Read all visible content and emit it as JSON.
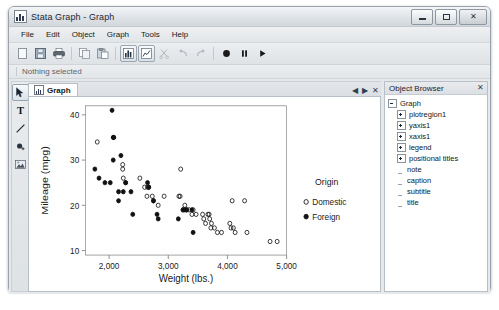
{
  "window": {
    "title": "Stata Graph - Graph",
    "icon": "stata-graph-icon",
    "buttons": {
      "minimize": "minimize-button",
      "maximize": "maximize-button",
      "close": "✕"
    }
  },
  "menu": {
    "items": [
      {
        "label": "File",
        "accel": "F"
      },
      {
        "label": "Edit",
        "accel": "E"
      },
      {
        "label": "Object",
        "accel": "O"
      },
      {
        "label": "Graph",
        "accel": "G"
      },
      {
        "label": "Tools",
        "accel": "T"
      },
      {
        "label": "Help",
        "accel": "H"
      }
    ]
  },
  "toolbar": {
    "buttons": [
      {
        "name": "new-icon",
        "active": false
      },
      {
        "name": "save-icon",
        "active": false
      },
      {
        "name": "print-icon",
        "active": false
      },
      {
        "name": "copy-icon",
        "active": false
      },
      {
        "name": "paste-icon",
        "active": false
      },
      {
        "name": "graph-editor-icon",
        "active": true
      },
      {
        "name": "grid-edit-icon",
        "active": true
      },
      {
        "name": "cut-scissors-icon",
        "active": false
      },
      {
        "name": "undo-icon",
        "active": false
      },
      {
        "name": "redo-icon",
        "active": false
      },
      {
        "name": "record-icon",
        "active": false
      },
      {
        "name": "pause-icon",
        "active": false
      },
      {
        "name": "play-icon",
        "active": false
      }
    ]
  },
  "status_strip": {
    "text": "Nothing selected"
  },
  "tool_palette": {
    "tools": [
      {
        "name": "pointer-tool-icon",
        "active": true
      },
      {
        "name": "text-tool-icon",
        "active": false
      },
      {
        "name": "line-tool-icon",
        "active": false
      },
      {
        "name": "marker-tool-icon",
        "active": false
      },
      {
        "name": "image-tool-icon",
        "active": false
      }
    ]
  },
  "document_tabs": {
    "tabs": [
      {
        "label": "Graph",
        "icon": "graph-tab-icon",
        "active": true
      }
    ],
    "nav": {
      "prev": "◀",
      "next": "▶",
      "close": "✕"
    }
  },
  "object_browser": {
    "title": "Object Browser",
    "close": "✕",
    "tree": [
      {
        "label": "Graph",
        "level": 1,
        "expander": "minus"
      },
      {
        "label": "plotregion1",
        "level": 2,
        "expander": "plus"
      },
      {
        "label": "yaxis1",
        "level": 2,
        "expander": "plus"
      },
      {
        "label": "xaxis1",
        "level": 2,
        "expander": "plus"
      },
      {
        "label": "legend",
        "level": 2,
        "expander": "plus"
      },
      {
        "label": "positional titles",
        "level": 2,
        "expander": "plus"
      },
      {
        "label": "note",
        "level": 2,
        "expander": "leaf"
      },
      {
        "label": "caption",
        "level": 2,
        "expander": "leaf"
      },
      {
        "label": "subtitle",
        "level": 2,
        "expander": "leaf"
      },
      {
        "label": "title",
        "level": 2,
        "expander": "leaf"
      }
    ]
  },
  "chart_data": {
    "type": "scatter",
    "title": "",
    "xlabel": "Weight (lbs.)",
    "ylabel": "Mileage (mpg)",
    "xlim": [
      1600,
      5000
    ],
    "ylim": [
      9,
      42
    ],
    "xticks": [
      2000,
      3000,
      4000,
      5000
    ],
    "xtick_labels": [
      "2,000",
      "3,000",
      "4,000",
      "5,000"
    ],
    "yticks": [
      10,
      20,
      30,
      40
    ],
    "ytick_labels": [
      "10",
      "20",
      "30",
      "40"
    ],
    "grid": false,
    "legend": {
      "title": "Origin",
      "position": "right",
      "entries": [
        {
          "name": "Domestic",
          "marker": "open-circle",
          "color": "#000000"
        },
        {
          "name": "Foreign",
          "marker": "filled-circle",
          "color": "#000000"
        }
      ]
    },
    "series": [
      {
        "name": "Domestic",
        "marker": "open-circle",
        "points": [
          [
            1800,
            34
          ],
          [
            2230,
            29
          ],
          [
            2230,
            28
          ],
          [
            2240,
            26
          ],
          [
            2280,
            25
          ],
          [
            2520,
            26
          ],
          [
            2600,
            24
          ],
          [
            2650,
            24
          ],
          [
            2670,
            24
          ],
          [
            2640,
            22
          ],
          [
            2730,
            22
          ],
          [
            2750,
            21
          ],
          [
            2830,
            20
          ],
          [
            2930,
            22
          ],
          [
            3180,
            22
          ],
          [
            3200,
            22
          ],
          [
            3210,
            28
          ],
          [
            3310,
            19
          ],
          [
            3250,
            19
          ],
          [
            3280,
            20
          ],
          [
            3350,
            19
          ],
          [
            3420,
            19
          ],
          [
            3400,
            18
          ],
          [
            3470,
            18
          ],
          [
            3580,
            18
          ],
          [
            3600,
            17
          ],
          [
            3630,
            16
          ],
          [
            3670,
            18
          ],
          [
            3690,
            18
          ],
          [
            3700,
            17
          ],
          [
            3720,
            15
          ],
          [
            3730,
            16
          ],
          [
            3780,
            15
          ],
          [
            3830,
            14
          ],
          [
            3900,
            14
          ],
          [
            4040,
            16
          ],
          [
            4060,
            15
          ],
          [
            4080,
            21
          ],
          [
            4100,
            15
          ],
          [
            4130,
            14
          ],
          [
            4290,
            21
          ],
          [
            4330,
            14
          ],
          [
            4720,
            12
          ],
          [
            4840,
            12
          ]
        ]
      },
      {
        "name": "Foreign",
        "marker": "filled-circle",
        "points": [
          [
            1760,
            28
          ],
          [
            1830,
            26
          ],
          [
            1930,
            25
          ],
          [
            2020,
            25
          ],
          [
            2050,
            41
          ],
          [
            2070,
            35
          ],
          [
            2080,
            35
          ],
          [
            2070,
            30
          ],
          [
            2160,
            23
          ],
          [
            2200,
            31
          ],
          [
            2240,
            23
          ],
          [
            2160,
            21
          ],
          [
            2280,
            25
          ],
          [
            2370,
            23
          ],
          [
            2400,
            18
          ],
          [
            2650,
            25
          ],
          [
            2670,
            24
          ],
          [
            2750,
            21
          ],
          [
            2810,
            18
          ],
          [
            2830,
            17
          ],
          [
            3170,
            17
          ],
          [
            3250,
            19
          ],
          [
            3280,
            19
          ],
          [
            3310,
            19
          ],
          [
            3420,
            14
          ],
          [
            3400,
            19
          ]
        ]
      }
    ]
  }
}
